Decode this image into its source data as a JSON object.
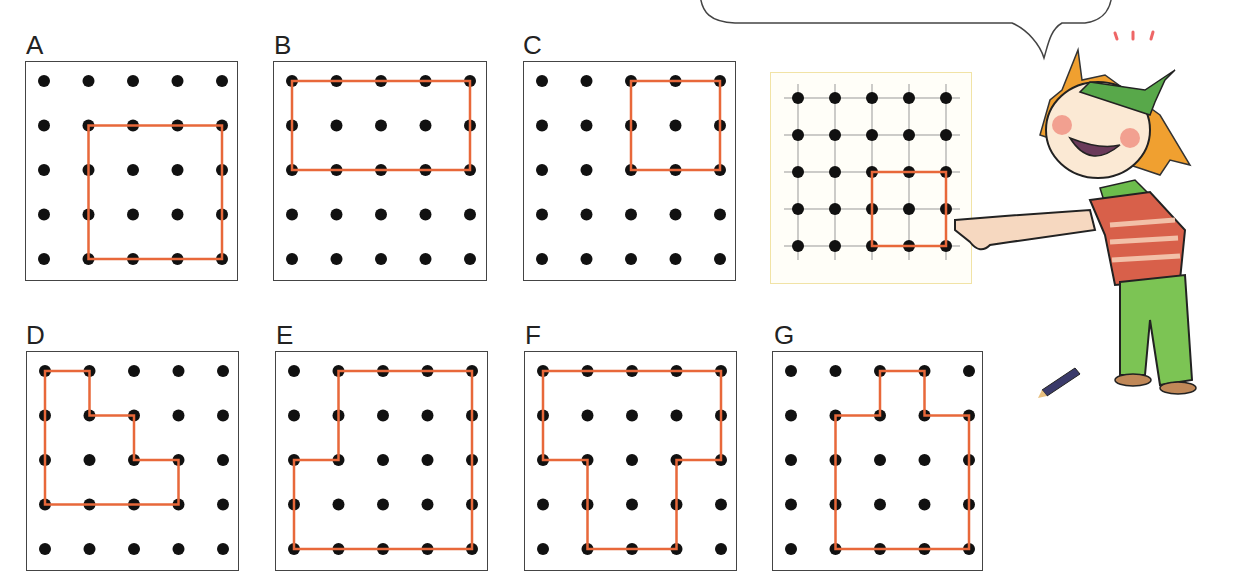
{
  "speech_bubble": {
    "text": "",
    "note": "text cut off at top edge of image"
  },
  "colors": {
    "outline": "#e8683a",
    "dot": "#111111",
    "frame": "#444444",
    "example_border": "#f1e3a6"
  },
  "panels": [
    {
      "label": "A",
      "outline": [
        [
          1,
          1
        ],
        [
          4,
          1
        ],
        [
          4,
          4
        ],
        [
          1,
          4
        ]
      ]
    },
    {
      "label": "B",
      "outline": [
        [
          0,
          0
        ],
        [
          4,
          0
        ],
        [
          4,
          2
        ],
        [
          0,
          2
        ]
      ]
    },
    {
      "label": "C",
      "outline": [
        [
          2,
          0
        ],
        [
          4,
          0
        ],
        [
          4,
          2
        ],
        [
          2,
          2
        ]
      ]
    },
    {
      "label": "D",
      "outline": [
        [
          0,
          0
        ],
        [
          1,
          0
        ],
        [
          1,
          1
        ],
        [
          2,
          1
        ],
        [
          2,
          2
        ],
        [
          3,
          2
        ],
        [
          3,
          3
        ],
        [
          0,
          3
        ]
      ]
    },
    {
      "label": "E",
      "outline": [
        [
          1,
          0
        ],
        [
          4,
          0
        ],
        [
          4,
          4
        ],
        [
          0,
          4
        ],
        [
          0,
          2
        ],
        [
          1,
          2
        ]
      ]
    },
    {
      "label": "F",
      "outline": [
        [
          0,
          0
        ],
        [
          4,
          0
        ],
        [
          4,
          2
        ],
        [
          3,
          2
        ],
        [
          3,
          4
        ],
        [
          1,
          4
        ],
        [
          1,
          2
        ],
        [
          0,
          2
        ]
      ]
    },
    {
      "label": "G",
      "outline": [
        [
          2,
          0
        ],
        [
          3,
          0
        ],
        [
          3,
          1
        ],
        [
          4,
          1
        ],
        [
          4,
          4
        ],
        [
          1,
          4
        ],
        [
          1,
          1
        ],
        [
          2,
          1
        ]
      ]
    }
  ],
  "example": {
    "grid": "5x5 pegboard with grid lines",
    "outline": [
      [
        2,
        2
      ],
      [
        4,
        2
      ],
      [
        4,
        4
      ],
      [
        2,
        4
      ]
    ]
  },
  "character": {
    "description": "cartoon child with green headband and scarf, striped red shirt, green trousers, pointing at example grid",
    "pencil_on_floor": true
  }
}
